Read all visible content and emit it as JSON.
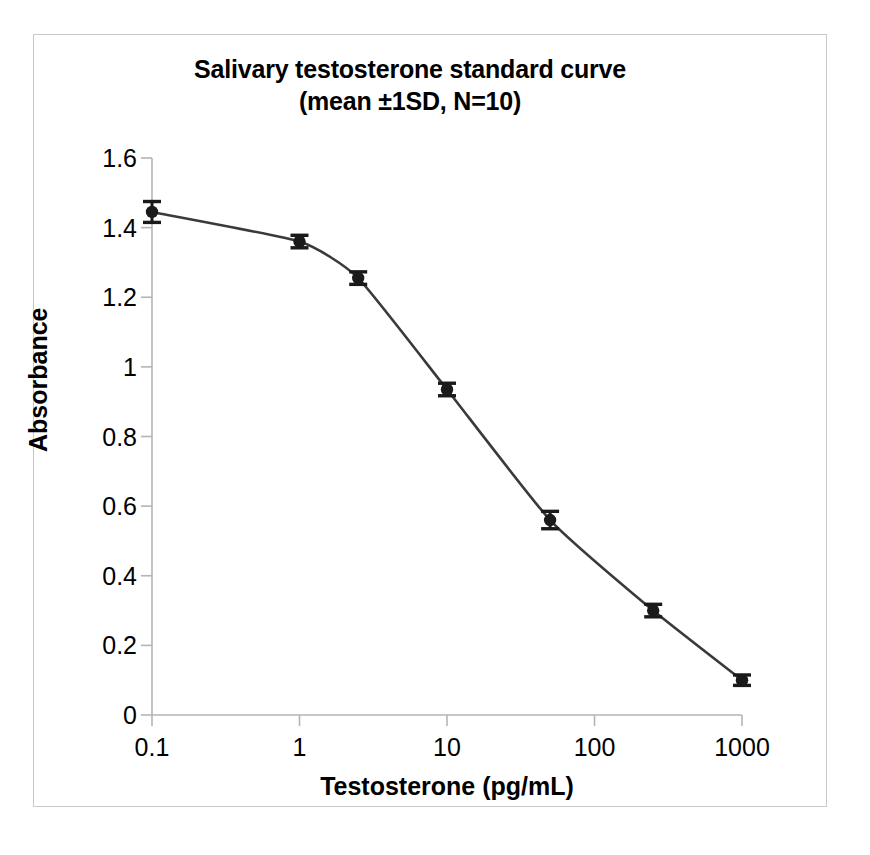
{
  "figure": {
    "title_line1": "Salivary testosterone standard curve",
    "title_line2": "(mean ±1SD, N=10)",
    "background_color": "#ffffff",
    "frame_color": "#c9c9c9"
  },
  "chart_data": {
    "type": "line",
    "title": "Salivary testosterone standard curve (mean ±1SD, N=10)",
    "xlabel": "Testosterone (pg/mL)",
    "ylabel": "Absorbance",
    "xscale": "log",
    "yscale": "linear",
    "xlim": [
      0.1,
      1000
    ],
    "ylim": [
      0,
      1.6
    ],
    "grid": false,
    "legend": "none",
    "marker": "filled-circle",
    "marker_color": "#1a1a1a",
    "line_color": "#3a3a3a",
    "errorbar_color": "#1a1a1a",
    "x": [
      0.1,
      1,
      2.5,
      10,
      50,
      250,
      1000
    ],
    "xtick_labels": [
      "0.1",
      "1",
      "10",
      "100",
      "1000"
    ],
    "xtick_values": [
      0.1,
      1,
      10,
      100,
      1000
    ],
    "ytick_labels": [
      "0",
      "0.2",
      "0.4",
      "0.6",
      "0.8",
      "1",
      "1.2",
      "1.4",
      "1.6"
    ],
    "ytick_values": [
      0,
      0.2,
      0.4,
      0.6,
      0.8,
      1,
      1.2,
      1.4,
      1.6
    ],
    "series": [
      {
        "name": "Absorbance (mean ±1SD, N=10)",
        "values": [
          1.445,
          1.36,
          1.255,
          0.935,
          0.56,
          0.3,
          0.1
        ],
        "errors": [
          0.03,
          0.018,
          0.018,
          0.018,
          0.025,
          0.018,
          0.015
        ]
      }
    ],
    "points": [
      {
        "x": 0.1,
        "y": 1.445,
        "sd": 0.03
      },
      {
        "x": 1,
        "y": 1.36,
        "sd": 0.018
      },
      {
        "x": 2.5,
        "y": 1.255,
        "sd": 0.018
      },
      {
        "x": 10,
        "y": 0.935,
        "sd": 0.018
      },
      {
        "x": 50,
        "y": 0.56,
        "sd": 0.025
      },
      {
        "x": 250,
        "y": 0.3,
        "sd": 0.018
      },
      {
        "x": 1000,
        "y": 0.1,
        "sd": 0.015
      }
    ]
  }
}
